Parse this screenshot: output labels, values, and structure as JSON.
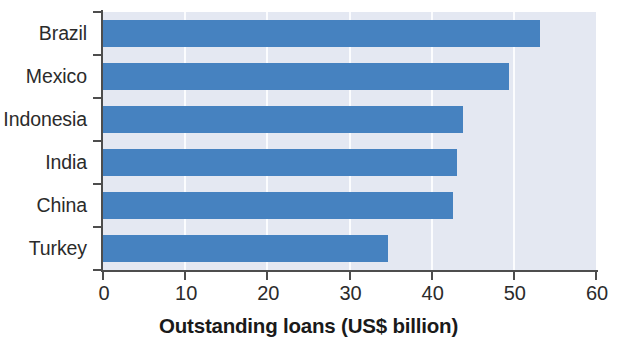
{
  "chart_data": {
    "type": "bar",
    "orientation": "horizontal",
    "title": "",
    "xlabel": "Outstanding loans (US$ billion)",
    "ylabel": "",
    "categories": [
      "Brazil",
      "Mexico",
      "Indonesia",
      "India",
      "China",
      "Turkey"
    ],
    "values": [
      53.2,
      49.4,
      43.8,
      43.1,
      42.6,
      34.7
    ],
    "xlim": [
      0,
      60
    ],
    "xticks": [
      0,
      10,
      20,
      30,
      40,
      50,
      60
    ],
    "xtick_labels": [
      "0",
      "10",
      "20",
      "30",
      "40",
      "50",
      "60"
    ],
    "grid": "vertical",
    "legend": "none",
    "series": [
      {
        "name": "Outstanding loans",
        "values": [
          53.2,
          49.4,
          43.8,
          43.1,
          42.6,
          34.7
        ]
      }
    ]
  },
  "colors": {
    "bar": "#4682c0",
    "plot_background": "#e4e8f2",
    "gridline": "#fbfcfe",
    "axis": "#4d4d4d",
    "label_text": "#2b2b2b",
    "title_text": "#1a1a1a",
    "page_background": "#ffffff"
  }
}
